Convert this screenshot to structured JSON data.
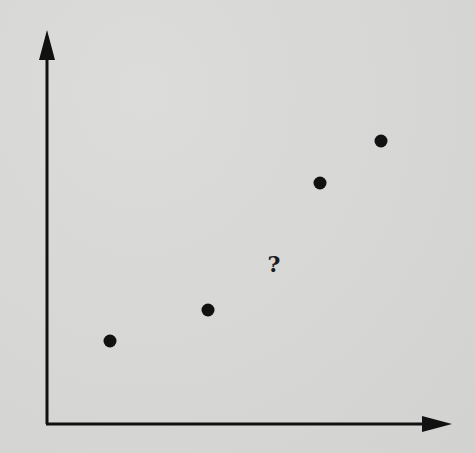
{
  "chart_data": {
    "type": "scatter",
    "title": "",
    "xlabel": "",
    "ylabel": "",
    "grid": false,
    "legend": null,
    "points": [
      {
        "x": 0.155,
        "y": 0.21
      },
      {
        "x": 0.398,
        "y": 0.29
      },
      {
        "x": 0.674,
        "y": 0.613
      },
      {
        "x": 0.825,
        "y": 0.72
      }
    ],
    "annotations": [
      {
        "text": "?",
        "x": 0.563,
        "y": 0.41
      }
    ]
  },
  "axes": {
    "origin_px": [
      47,
      424
    ],
    "x_end_px": [
      452,
      424
    ],
    "y_end_px": [
      47,
      30
    ]
  },
  "points_px": [
    {
      "cx": 110,
      "cy": 341
    },
    {
      "cx": 208,
      "cy": 310
    },
    {
      "cx": 320,
      "cy": 183
    },
    {
      "cx": 381,
      "cy": 141
    }
  ],
  "missing_marker": {
    "text": "?",
    "x_px": 274,
    "y_px": 264
  },
  "colors": {
    "axis": "#111111",
    "point": "#111111",
    "background": "#d9d9d7"
  }
}
